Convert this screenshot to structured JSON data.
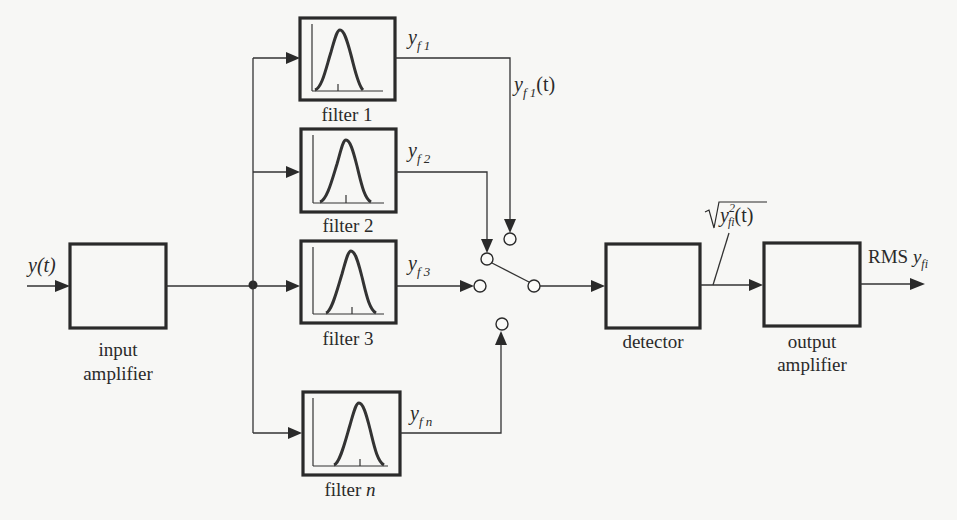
{
  "diagram": {
    "input_signal": "y(t)",
    "blocks": {
      "input_amplifier": {
        "line1": "input",
        "line2": "amplifier"
      },
      "detector": {
        "label": "detector"
      },
      "output_amplifier": {
        "line1": "output",
        "line2": "amplifier"
      }
    },
    "filters": [
      {
        "label": "filter 1",
        "output_base": "y",
        "output_sub": "f 1"
      },
      {
        "label": "filter 2",
        "output_base": "y",
        "output_sub": "f 2"
      },
      {
        "label": "filter 3",
        "output_base": "y",
        "output_sub": "f 3"
      },
      {
        "label_prefix": "filter ",
        "label_var": "n",
        "output_base": "y",
        "output_sub": "f n"
      }
    ],
    "switch_label": {
      "base": "y",
      "sub": "f 1",
      "suffix": "(t)"
    },
    "detector_output": {
      "base": "y",
      "sup": "2",
      "sub": "fi",
      "suffix": "(t)"
    },
    "final_output": {
      "prefix": "RMS ",
      "base": "y",
      "sub": "fi"
    }
  }
}
